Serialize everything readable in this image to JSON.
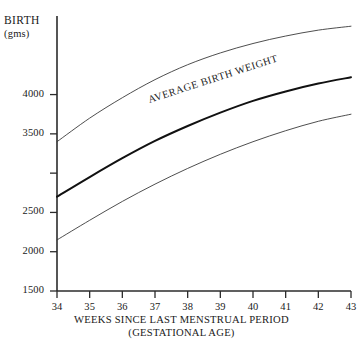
{
  "chart_data": {
    "type": "line",
    "title": "",
    "xlabel": "WEEKS SINCE LAST MENSTRUAL PERIOD (GESTATIONAL AGE)",
    "xlabel_line1": "WEEKS SINCE LAST MENSTRUAL PERIOD",
    "xlabel_line2": "(GESTATIONAL AGE)",
    "ylabel": "BIRTH",
    "ylabel_line1": "BIRTH",
    "ylabel_line2": "(gms)",
    "yunit": "gms",
    "grid": false,
    "legend": "none",
    "annotations": [
      {
        "text": "AVERAGE BIRTH WEIGHT",
        "attached_series": "Average birth weight",
        "x": 39.2,
        "y": 4080
      }
    ],
    "xlim": [
      34,
      43
    ],
    "ylim": [
      1500,
      5000
    ],
    "x": [
      34,
      35,
      36,
      37,
      38,
      39,
      40,
      41,
      42,
      43
    ],
    "xtick_labels": [
      "34",
      "35",
      "36",
      "37",
      "38",
      "39",
      "40",
      "41",
      "42",
      "43"
    ],
    "ytick_values": [
      1500,
      2000,
      2500,
      3000,
      3500,
      4000
    ],
    "ytick_labels": [
      "1500",
      "2000",
      "2500",
      "3000",
      "3500",
      "4000"
    ],
    "ytick_labels_visible": [
      "1500",
      "2000",
      "2500",
      "",
      "3500",
      "4000"
    ],
    "series": [
      {
        "name": "Upper percentile",
        "style": "thin",
        "color": "#3a3a3a",
        "values": [
          3400,
          3700,
          3960,
          4190,
          4380,
          4530,
          4650,
          4745,
          4820,
          4870
        ]
      },
      {
        "name": "Average birth weight",
        "style": "bold",
        "color": "#111111",
        "values": [
          2700,
          2950,
          3190,
          3410,
          3600,
          3770,
          3920,
          4040,
          4140,
          4220
        ]
      },
      {
        "name": "Lower percentile",
        "style": "thin",
        "color": "#3a3a3a",
        "values": [
          2150,
          2400,
          2640,
          2860,
          3060,
          3240,
          3400,
          3540,
          3660,
          3750
        ]
      }
    ]
  }
}
